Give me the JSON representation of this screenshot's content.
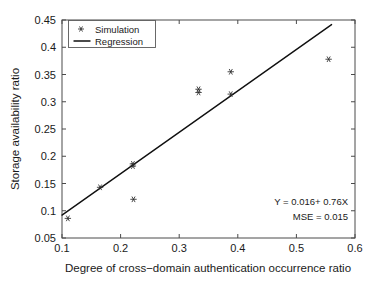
{
  "chart_data": {
    "type": "scatter",
    "title": "",
    "xlabel": "Degree of cross−domain authentication occurrence ratio",
    "ylabel": "Storage availability ratio",
    "xlim": [
      0.1,
      0.6
    ],
    "ylim": [
      0.05,
      0.45
    ],
    "xticks": [
      "0.1",
      "0.2",
      "0.3",
      "0.4",
      "0.5",
      "0.6"
    ],
    "xtick_values": [
      0.1,
      0.2,
      0.3,
      0.4,
      0.5,
      0.6
    ],
    "yticks": [
      "0.05",
      "0.1",
      "0.15",
      "0.2",
      "0.25",
      "0.3",
      "0.35",
      "0.4",
      "0.45"
    ],
    "ytick_values": [
      0.05,
      0.1,
      0.15,
      0.2,
      0.25,
      0.3,
      0.35,
      0.4,
      0.45
    ],
    "grid": false,
    "legend_position": "upper left",
    "series": [
      {
        "name": "Simulation",
        "type": "scatter",
        "marker": "asterisk",
        "color": "#2a2a2a",
        "points": [
          {
            "x": 0.11,
            "y": 0.086
          },
          {
            "x": 0.165,
            "y": 0.143
          },
          {
            "x": 0.221,
            "y": 0.186
          },
          {
            "x": 0.221,
            "y": 0.182
          },
          {
            "x": 0.222,
            "y": 0.121
          },
          {
            "x": 0.333,
            "y": 0.323
          },
          {
            "x": 0.333,
            "y": 0.317
          },
          {
            "x": 0.388,
            "y": 0.355
          },
          {
            "x": 0.388,
            "y": 0.314
          },
          {
            "x": 0.555,
            "y": 0.378
          }
        ]
      },
      {
        "name": "Regression",
        "type": "line",
        "color": "#101010",
        "equation": "Y = 0.016 + 0.76X",
        "slope": 0.76,
        "intercept": 0.016,
        "x_start": 0.1,
        "x_end": 0.56
      }
    ],
    "annotations": [
      {
        "text": "Y = 0.016+ 0.76X"
      },
      {
        "text": "MSE = 0.015"
      }
    ]
  },
  "legend": {
    "items": [
      {
        "label": "Simulation",
        "glyph": "asterisk-marker"
      },
      {
        "label": "Regression",
        "glyph": "line-swatch"
      }
    ]
  },
  "annotation": {
    "equation": "Y = 0.016+ 0.76X",
    "mse": "MSE = 0.015"
  },
  "axes": {
    "x_title": "Degree of cross−domain authentication occurrence ratio",
    "y_title": "Storage availability ratio"
  },
  "colors": {
    "axis": "#4a4a4a",
    "marker": "#2a2a2a",
    "line": "#101010",
    "text": "#1a1a1a",
    "background": "#ffffff"
  }
}
